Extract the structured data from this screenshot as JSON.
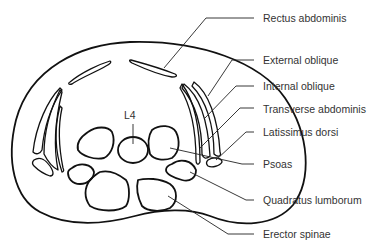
{
  "figure": {
    "type": "anatomical cross-section diagram",
    "vertebra_label": "L4",
    "labels": [
      {
        "id": "rectus-abdominis",
        "text": "Rectus abdominis"
      },
      {
        "id": "external-oblique",
        "text": "External oblique"
      },
      {
        "id": "internal-oblique",
        "text": "Internal oblique"
      },
      {
        "id": "transverse-abdominis",
        "text": "Transverse abdominis"
      },
      {
        "id": "latissimus-dorsi",
        "text": "Latissimus dorsi"
      },
      {
        "id": "psoas",
        "text": "Psoas"
      },
      {
        "id": "quadratus-lumborum",
        "text": "Quadratus lumborum"
      },
      {
        "id": "erector-spinae",
        "text": "Erector spinae"
      }
    ]
  },
  "colors": {
    "line": "#111111",
    "text": "#333333",
    "background": "#ffffff"
  }
}
